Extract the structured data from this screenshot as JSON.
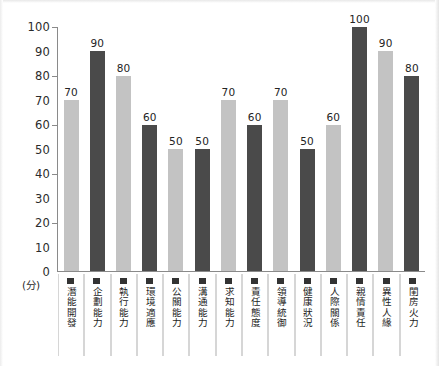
{
  "chart_data": {
    "type": "bar",
    "title": "",
    "subtitle": "",
    "xlabel": "",
    "ylabel": "",
    "unit_caption": "(分)",
    "ylim": [
      0,
      100
    ],
    "ytick_step": 10,
    "ytick_labels": [
      "100",
      "90",
      "80",
      "70",
      "60",
      "50",
      "40",
      "30",
      "20",
      "10",
      "0"
    ],
    "ytick_values": [
      100,
      90,
      80,
      70,
      60,
      50,
      40,
      30,
      20,
      10,
      0
    ],
    "major_tick_values": [
      100,
      80,
      60,
      40,
      20
    ],
    "grid": false,
    "legend_position": "none",
    "categories": [
      "潛能開發",
      "企劃能力",
      "執行能力",
      "環境適應",
      "公關能力",
      "溝通能力",
      "求知能力",
      "責任態度",
      "領導統御",
      "健康狀況",
      "人際關係",
      "親情責任",
      "異性人緣",
      "閨房火力"
    ],
    "values": [
      70,
      90,
      80,
      60,
      50,
      50,
      70,
      60,
      70,
      50,
      60,
      100,
      90,
      80
    ],
    "value_labels": [
      "70",
      "90",
      "80",
      "60",
      "50",
      "50",
      "70",
      "60",
      "70",
      "50",
      "60",
      "100",
      "90",
      "80"
    ],
    "bar_shades": [
      "light",
      "dark",
      "light",
      "dark",
      "light",
      "dark",
      "light",
      "dark",
      "light",
      "dark",
      "light",
      "dark",
      "light",
      "dark"
    ],
    "colors": {
      "bar_light": "#c3c3c3",
      "bar_dark": "#4a4a4a",
      "axis": "#8a8a8a",
      "text": "#1d1d1d",
      "legend_swatch": "#333333",
      "cell_divider": "#d6d6d6",
      "background": "#ffffff"
    }
  }
}
